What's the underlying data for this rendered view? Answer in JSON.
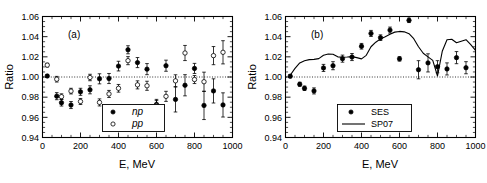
{
  "figure": {
    "panels": [
      {
        "id": "a",
        "label": "(a)",
        "xlabel": "E, MeV",
        "ylabel": "Ratio",
        "legend": [
          {
            "marker": "filled-circle",
            "label": "np"
          },
          {
            "marker": "open-circle",
            "label": "pp"
          }
        ]
      },
      {
        "id": "b",
        "label": "(b)",
        "xlabel": "E, MeV",
        "ylabel": "Ratio",
        "legend": [
          {
            "marker": "filled-circle",
            "label": "SES"
          },
          {
            "marker": "line",
            "label": "SP07"
          }
        ]
      }
    ],
    "axis": {
      "xticks": [
        "0",
        "200",
        "400",
        "600",
        "800",
        "1000"
      ],
      "yticks": [
        "0.94",
        "0.96",
        "0.98",
        "1.00",
        "1.02",
        "1.04",
        "1.06"
      ]
    }
  },
  "chart_data": [
    {
      "type": "scatter",
      "panel": "(a)",
      "title": "",
      "xlabel": "E, MeV",
      "ylabel": "Ratio",
      "xlim": [
        0,
        1000
      ],
      "ylim": [
        0.94,
        1.06
      ],
      "xticks": [
        0,
        200,
        400,
        600,
        800,
        1000
      ],
      "yticks": [
        0.94,
        0.96,
        0.98,
        1.0,
        1.02,
        1.04,
        1.06
      ],
      "xminor_step": 50,
      "yminor_step": 0.005,
      "grid": false,
      "reference_line": 1.0,
      "legend_position": "lower-center",
      "series": [
        {
          "name": "np",
          "marker": "filled-circle",
          "x": [
            25,
            75,
            100,
            150,
            200,
            250,
            300,
            350,
            400,
            450,
            500,
            550,
            600,
            650,
            700,
            750,
            800,
            850,
            900,
            950
          ],
          "y": [
            1.001,
            0.981,
            0.9745,
            0.9722,
            0.9853,
            0.9873,
            0.9982,
            0.9985,
            1.0108,
            1.027,
            1.0143,
            1.0078,
            0.9728,
            1.0112,
            0.9778,
            0.9918,
            1.0085,
            0.9718,
            0.9862,
            0.9723
          ],
          "yerr": [
            0.0012,
            0.0035,
            0.0033,
            0.0035,
            0.0035,
            0.004,
            0.005,
            0.005,
            0.0048,
            0.004,
            0.005,
            0.0055,
            0.005,
            0.0055,
            0.0125,
            0.0105,
            0.005,
            0.014,
            0.012,
            0.012
          ]
        },
        {
          "name": "pp",
          "marker": "open-circle",
          "x": [
            25,
            75,
            100,
            150,
            200,
            250,
            300,
            350,
            400,
            450,
            500,
            550,
            600,
            650,
            700,
            750,
            800,
            850,
            900,
            950
          ],
          "y": [
            1.0118,
            0.9978,
            0.9805,
            0.986,
            0.9757,
            0.9995,
            0.9748,
            0.9832,
            0.9888,
            1.0162,
            0.9922,
            0.9913,
            0.9718,
            0.9808,
            0.9962,
            1.0238,
            0.9975,
            0.9953,
            1.0212,
            1.0245
          ],
          "yerr": [
            0.0018,
            0.0028,
            0.0028,
            0.0028,
            0.003,
            0.0032,
            0.0035,
            0.0035,
            0.0038,
            0.004,
            0.004,
            0.0045,
            0.0048,
            0.005,
            0.006,
            0.0075,
            0.004,
            0.0095,
            0.009,
            0.0115
          ]
        }
      ]
    },
    {
      "type": "scatter",
      "panel": "(b)",
      "title": "",
      "xlabel": "E, MeV",
      "ylabel": "Ratio",
      "xlim": [
        0,
        1000
      ],
      "ylim": [
        0.94,
        1.06
      ],
      "xticks": [
        0,
        200,
        400,
        600,
        800,
        1000
      ],
      "yticks": [
        0.94,
        0.96,
        0.98,
        1.0,
        1.02,
        1.04,
        1.06
      ],
      "xminor_step": 50,
      "yminor_step": 0.005,
      "grid": false,
      "reference_line": 1.0,
      "legend_position": "lower-center",
      "series": [
        {
          "name": "SES",
          "marker": "filled-circle",
          "x": [
            25,
            75,
            100,
            150,
            200,
            250,
            300,
            350,
            400,
            450,
            500,
            550,
            600,
            650,
            700,
            750,
            800,
            850,
            900,
            950
          ],
          "y": [
            1.0008,
            0.9928,
            0.9888,
            0.9862,
            1.009,
            1.0112,
            1.0182,
            1.0198,
            1.0305,
            1.0432,
            1.039,
            1.0465,
            1.018,
            1.0562,
            1.0072,
            1.014,
            1.0102,
            1.008,
            1.0192,
            1.0092
          ],
          "yerr": [
            0.0015,
            0.002,
            0.0022,
            0.003,
            0.0035,
            0.004,
            0.0035,
            0.0035,
            0.0028,
            0.003,
            0.0028,
            0.003,
            0.0022,
            0.0022,
            0.009,
            0.009,
            0.006,
            0.006,
            0.006,
            0.006
          ]
        },
        {
          "name": "SP07",
          "marker": "line",
          "x": [
            20,
            50,
            75,
            100,
            125,
            150,
            175,
            200,
            225,
            250,
            275,
            300,
            325,
            350,
            375,
            400,
            425,
            450,
            475,
            500,
            525,
            550,
            575,
            600,
            625,
            650,
            675,
            700,
            725,
            750,
            775,
            800,
            825,
            850,
            875,
            900,
            925,
            950,
            975,
            1000
          ],
          "y": [
            1.0005,
            1.0085,
            1.014,
            1.0162,
            1.0172,
            1.0175,
            1.0182,
            1.0215,
            1.0228,
            1.0225,
            1.02,
            1.0196,
            1.0198,
            1.0202,
            1.0192,
            1.018,
            1.0215,
            1.03,
            1.0345,
            1.0378,
            1.04,
            1.0425,
            1.0445,
            1.0452,
            1.0448,
            1.043,
            1.038,
            1.03,
            1.0235,
            1.02,
            1.0165,
            1.001,
            1.0255,
            1.037,
            1.0375,
            1.034,
            1.0355,
            1.037,
            1.032,
            1.0265
          ]
        }
      ]
    }
  ]
}
